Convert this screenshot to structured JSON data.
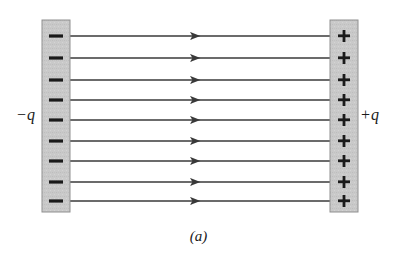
{
  "figure": {
    "caption": "(a)",
    "background_color": "#ffffff",
    "line_color": "#3a3a3a",
    "plate_fill": "#c9c9c9",
    "plate_stroke": "#8f8f8f",
    "sign_color": "#1a1a1a"
  },
  "left_plate": {
    "charge_label": "−q",
    "sign_glyph": "−",
    "sign_count": 9,
    "polarity": "negative",
    "x": 42,
    "y": 20,
    "width": 28,
    "height": 192
  },
  "right_plate": {
    "charge_label": "+q",
    "sign_glyph": "+",
    "sign_count": 9,
    "polarity": "positive",
    "x": 330,
    "y": 20,
    "width": 28,
    "height": 192
  },
  "chart_data": {
    "type": "line",
    "title": "(a)",
    "xlabel": "",
    "ylabel": "",
    "series": [
      {
        "name": "field-line-1",
        "y": 36,
        "x_start": 70,
        "x_end": 330,
        "arrow_x": 200,
        "direction": "left"
      },
      {
        "name": "field-line-2",
        "y": 58,
        "x_start": 70,
        "x_end": 330,
        "arrow_x": 200,
        "direction": "left"
      },
      {
        "name": "field-line-3",
        "y": 80,
        "x_start": 70,
        "x_end": 330,
        "arrow_x": 200,
        "direction": "left"
      },
      {
        "name": "field-line-4",
        "y": 100,
        "x_start": 70,
        "x_end": 330,
        "arrow_x": 200,
        "direction": "left"
      },
      {
        "name": "field-line-5",
        "y": 120,
        "x_start": 70,
        "x_end": 330,
        "arrow_x": 200,
        "direction": "left"
      },
      {
        "name": "field-line-6",
        "y": 141,
        "x_start": 70,
        "x_end": 330,
        "arrow_x": 200,
        "direction": "left"
      },
      {
        "name": "field-line-7",
        "y": 161,
        "x_start": 70,
        "x_end": 330,
        "arrow_x": 200,
        "direction": "left"
      },
      {
        "name": "field-line-8",
        "y": 182,
        "x_start": 70,
        "x_end": 330,
        "arrow_x": 200,
        "direction": "left"
      },
      {
        "name": "field-line-9",
        "y": 201,
        "x_start": 70,
        "x_end": 330,
        "arrow_x": 200,
        "direction": "left"
      }
    ],
    "legend": [],
    "grid": false,
    "annotations": [
      {
        "text": "−q",
        "x": 16,
        "y": 114
      },
      {
        "text": "+q",
        "x": 360,
        "y": 114
      },
      {
        "text": "(a)",
        "x": 198,
        "y": 240
      }
    ]
  }
}
